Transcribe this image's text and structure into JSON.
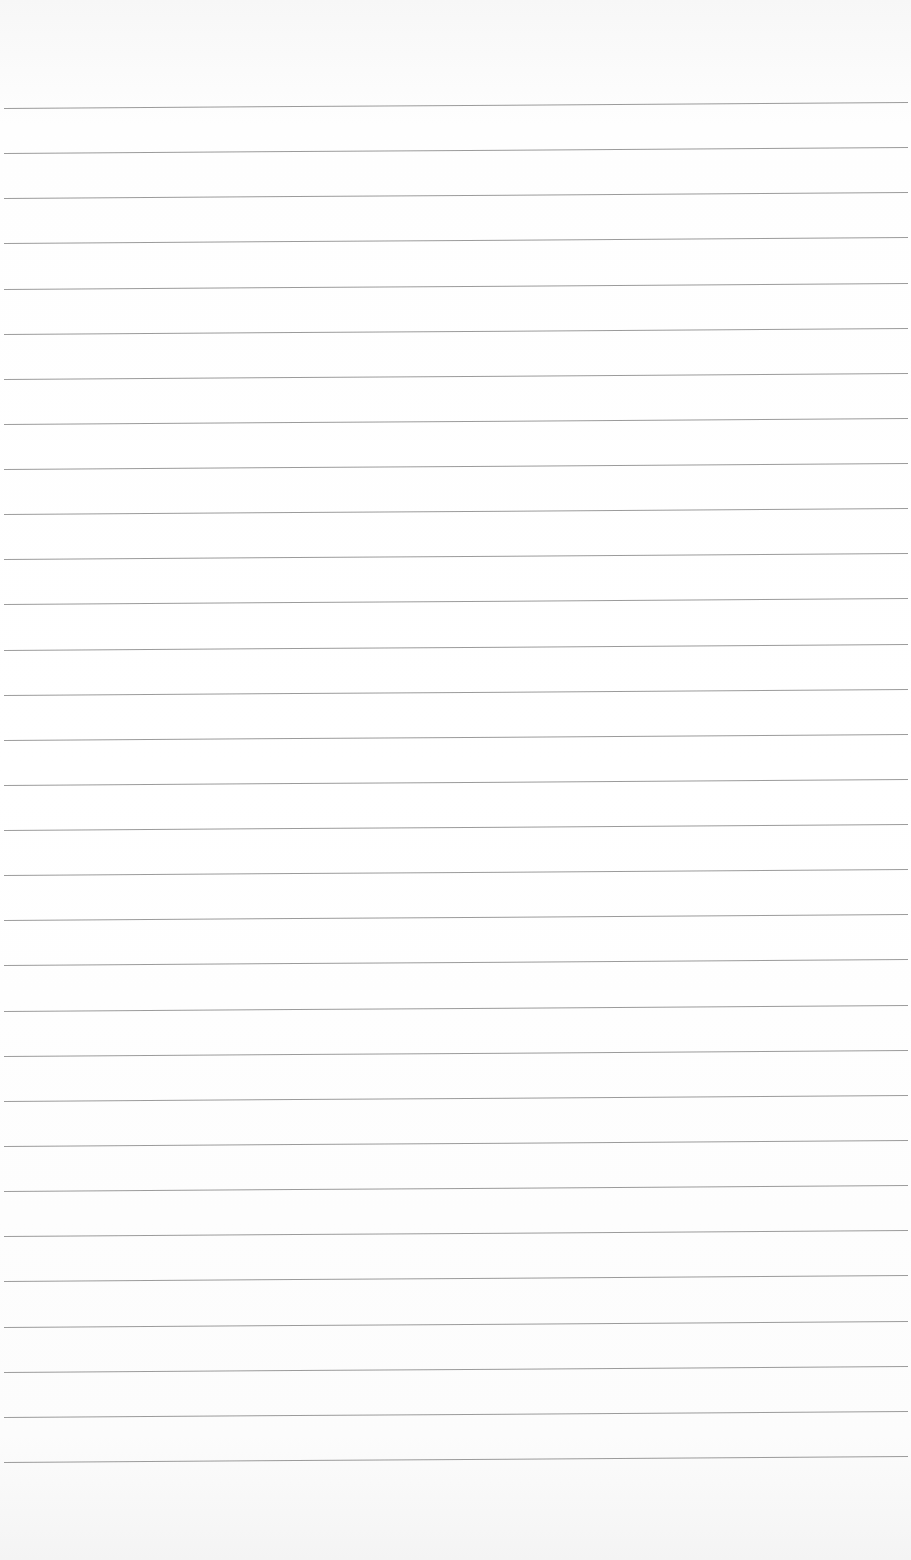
{
  "paper": {
    "kind": "ruled-sheet",
    "line_count": 31,
    "first_line_y": 108,
    "line_spacing": 45.13,
    "line_color": "#8a8a8a",
    "background_color": "#ffffff"
  }
}
